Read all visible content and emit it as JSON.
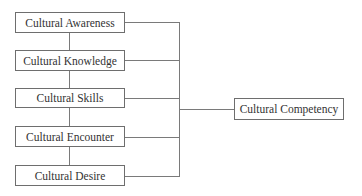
{
  "diagram": {
    "type": "flow",
    "components": [
      {
        "id": "awareness",
        "label": "Cultural Awareness"
      },
      {
        "id": "knowledge",
        "label": "Cultural Knowledge"
      },
      {
        "id": "skills",
        "label": "Cultural Skills"
      },
      {
        "id": "encounter",
        "label": "Cultural Encounter"
      },
      {
        "id": "desire",
        "label": "Cultural Desire"
      }
    ],
    "outcome": {
      "id": "competency",
      "label": "Cultural Competency"
    },
    "edges": [
      [
        "awareness",
        "knowledge"
      ],
      [
        "knowledge",
        "skills"
      ],
      [
        "skills",
        "encounter"
      ],
      [
        "encounter",
        "desire"
      ],
      [
        "awareness",
        "competency"
      ],
      [
        "knowledge",
        "competency"
      ],
      [
        "skills",
        "competency"
      ],
      [
        "encounter",
        "competency"
      ],
      [
        "desire",
        "competency"
      ]
    ],
    "colors": {
      "stroke": "#6e6e6e",
      "text": "#333333",
      "background": "#ffffff"
    }
  }
}
